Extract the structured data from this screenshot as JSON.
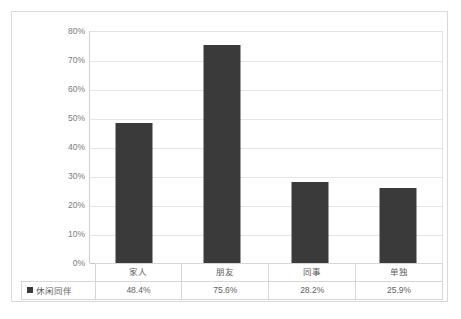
{
  "chart_data": {
    "type": "bar",
    "title": "",
    "xlabel": "",
    "ylabel": "",
    "categories": [
      "家人",
      "朋友",
      "同事",
      "单独"
    ],
    "values": [
      48.4,
      75.6,
      28.2,
      25.9
    ],
    "value_labels": [
      "48.4%",
      "75.6%",
      "28.2%",
      "25.9%"
    ],
    "series": [
      {
        "name": "休闲同伴",
        "values": [
          48.4,
          75.6,
          28.2,
          25.9
        ],
        "color": "#3a3a3a"
      }
    ],
    "ylim": [
      0,
      80
    ],
    "ytick_values": [
      80,
      70,
      60,
      50,
      40,
      30,
      20,
      10,
      0
    ],
    "ytick_labels": [
      "80%",
      "70%",
      "60%",
      "50%",
      "40%",
      "30%",
      "20%",
      "10%",
      "0%"
    ],
    "grid": true,
    "legend_position": "data-table",
    "has_data_table": true
  },
  "colors": {
    "bar": "#3a3a3a",
    "gridline": "#e6e6e6",
    "axis": "#c9c9c9",
    "border": "#d9d9d9",
    "text": "#7a7a7a",
    "table_border": "#d6d6d6"
  },
  "table": {
    "legend_label": "休闲同伴",
    "legend_marker": "square-marker",
    "header_cells": [
      "家人",
      "朋友",
      "同事",
      "单独"
    ],
    "value_cells": [
      "48.4%",
      "75.6%",
      "28.2%",
      "25.9%"
    ]
  }
}
